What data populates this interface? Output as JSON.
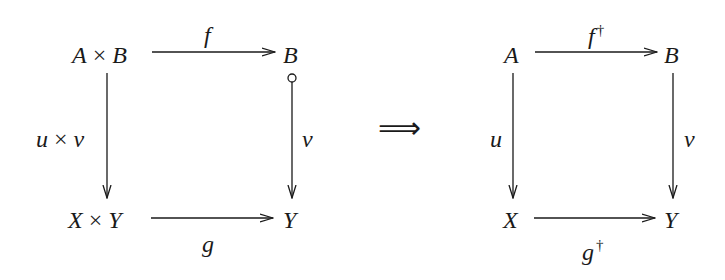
{
  "left_diagram": {
    "nodes": {
      "top_left": {
        "a": "A",
        "times": "×",
        "b": "B"
      },
      "top_right": "B",
      "bottom_left": {
        "a": "X",
        "times": "×",
        "b": "Y"
      },
      "bottom_right": "Y"
    },
    "arrows": {
      "top": {
        "label": "f"
      },
      "left": {
        "label_a": "u",
        "times": "×",
        "label_b": "v"
      },
      "right": {
        "label": "v",
        "tail": "circle"
      },
      "bottom": {
        "label": "g"
      }
    }
  },
  "implies": "⟹",
  "right_diagram": {
    "nodes": {
      "top_left": "A",
      "top_right": "B",
      "bottom_left": "X",
      "bottom_right": "Y"
    },
    "arrows": {
      "top": {
        "label": "f",
        "sup": "†"
      },
      "left": {
        "label": "u"
      },
      "right": {
        "label": "v"
      },
      "bottom": {
        "label": "g",
        "sup": "†"
      }
    }
  }
}
